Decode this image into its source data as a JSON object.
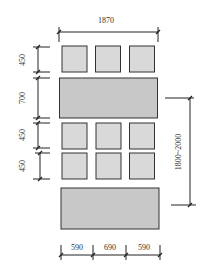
{
  "diagram": {
    "colors": {
      "small_box_fill": "#d9d9d9",
      "large_box_fill": "#c8c8c8",
      "stroke": "#333333",
      "dim_line": "#222222"
    },
    "dimensions": {
      "top_width": "1870",
      "left": [
        "450",
        "700",
        "450",
        "450"
      ],
      "right_height": "1800~2000",
      "bottom": [
        "590",
        "690",
        "590"
      ]
    },
    "layout": {
      "rows": [
        {
          "type": "small-row",
          "count": 3
        },
        {
          "type": "large-panel"
        },
        {
          "type": "small-row",
          "count": 3
        },
        {
          "type": "small-row",
          "count": 3
        },
        {
          "type": "large-panel"
        }
      ]
    }
  }
}
